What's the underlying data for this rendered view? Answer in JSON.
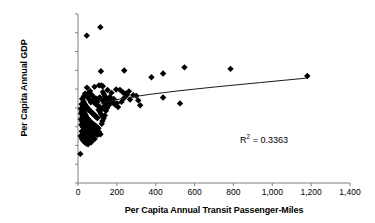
{
  "chart_data": {
    "type": "scatter",
    "title": "",
    "xlabel": "Per Capita Annual Transit Passenger-Miles",
    "ylabel": "Per Capita Annual GDP",
    "xlim": [
      0,
      1400
    ],
    "ylim": [
      0,
      90000
    ],
    "xticks": [
      0,
      200,
      400,
      600,
      800,
      1000,
      1200,
      1400
    ],
    "xticklabels": [
      "0",
      "200",
      "400",
      "600",
      "800",
      "1,000",
      "1,200",
      "1,400"
    ],
    "yticks": [
      0,
      10000,
      20000,
      30000,
      40000,
      50000,
      60000,
      70000,
      80000,
      90000
    ],
    "yticklabels": [
      "$0",
      "$10,000",
      "$20,000",
      "$30,000",
      "$40,000",
      "$50,000",
      "$60,000",
      "$70,000",
      "$80,000",
      "$90,000"
    ],
    "grid": false,
    "legend": null,
    "annotations": [
      {
        "name": "r-squared",
        "text": "R2 = 0.3363",
        "value": 0.3363,
        "x": 900,
        "y": 24000
      }
    ],
    "marker": {
      "shape": "diamond",
      "color": "#000000",
      "size": 3.2
    },
    "trendline": {
      "type": "logarithmic",
      "color": "#1a1a1a",
      "width": 1,
      "points": [
        [
          110,
          41800
        ],
        [
          140,
          42900
        ],
        [
          175,
          43900
        ],
        [
          215,
          44700
        ],
        [
          260,
          45500
        ],
        [
          310,
          46300
        ],
        [
          370,
          47200
        ],
        [
          440,
          48100
        ],
        [
          520,
          49100
        ],
        [
          610,
          50100
        ],
        [
          710,
          51200
        ],
        [
          820,
          52300
        ],
        [
          940,
          53500
        ],
        [
          1060,
          54700
        ],
        [
          1180,
          55900
        ]
      ]
    },
    "points": [
      [
        12,
        15500
      ],
      [
        45,
        78500
      ],
      [
        115,
        83000
      ],
      [
        118,
        59500
      ],
      [
        238,
        59900
      ],
      [
        548,
        61600
      ],
      [
        785,
        60800
      ],
      [
        378,
        56300
      ],
      [
        438,
        58300
      ],
      [
        1180,
        57000
      ],
      [
        85,
        51200
      ],
      [
        108,
        52000
      ],
      [
        120,
        51900
      ],
      [
        128,
        51500
      ],
      [
        152,
        49500
      ],
      [
        172,
        48000
      ],
      [
        196,
        49800
      ],
      [
        216,
        49600
      ],
      [
        232,
        48200
      ],
      [
        252,
        47000
      ],
      [
        300,
        46400
      ],
      [
        70,
        47000
      ],
      [
        78,
        46000
      ],
      [
        92,
        45000
      ],
      [
        96,
        44200
      ],
      [
        100,
        43200
      ],
      [
        112,
        45600
      ],
      [
        124,
        44300
      ],
      [
        136,
        43000
      ],
      [
        148,
        42000
      ],
      [
        160,
        41500
      ],
      [
        180,
        42800
      ],
      [
        200,
        42500
      ],
      [
        236,
        45100
      ],
      [
        268,
        44500
      ],
      [
        320,
        41400
      ],
      [
        438,
        45500
      ],
      [
        525,
        42400
      ],
      [
        22,
        44800
      ],
      [
        28,
        43500
      ],
      [
        32,
        42500
      ],
      [
        36,
        41800
      ],
      [
        40,
        41000
      ],
      [
        44,
        40500
      ],
      [
        48,
        40000
      ],
      [
        52,
        39500
      ],
      [
        56,
        39000
      ],
      [
        60,
        38600
      ],
      [
        64,
        38200
      ],
      [
        68,
        37800
      ],
      [
        72,
        37400
      ],
      [
        76,
        37000
      ],
      [
        80,
        36600
      ],
      [
        84,
        36200
      ],
      [
        88,
        35800
      ],
      [
        92,
        35400
      ],
      [
        96,
        35000
      ],
      [
        100,
        34600
      ],
      [
        18,
        42000
      ],
      [
        24,
        40200
      ],
      [
        30,
        38800
      ],
      [
        34,
        37600
      ],
      [
        38,
        36500
      ],
      [
        42,
        35500
      ],
      [
        46,
        34800
      ],
      [
        50,
        34200
      ],
      [
        54,
        33600
      ],
      [
        58,
        33000
      ],
      [
        62,
        32500
      ],
      [
        66,
        32000
      ],
      [
        70,
        31500
      ],
      [
        74,
        31000
      ],
      [
        78,
        30500
      ],
      [
        82,
        30000
      ],
      [
        86,
        29500
      ],
      [
        90,
        29000
      ],
      [
        94,
        28500
      ],
      [
        98,
        28000
      ],
      [
        14,
        39500
      ],
      [
        20,
        38000
      ],
      [
        26,
        36800
      ],
      [
        33,
        35800
      ],
      [
        39,
        35000
      ],
      [
        45,
        34300
      ],
      [
        51,
        33700
      ],
      [
        57,
        33100
      ],
      [
        63,
        32600
      ],
      [
        69,
        32100
      ],
      [
        75,
        31600
      ],
      [
        81,
        31100
      ],
      [
        87,
        30600
      ],
      [
        93,
        30100
      ],
      [
        99,
        29600
      ],
      [
        105,
        29100
      ],
      [
        16,
        37000
      ],
      [
        23,
        35600
      ],
      [
        29,
        34500
      ],
      [
        35,
        33600
      ],
      [
        41,
        32900
      ],
      [
        47,
        32300
      ],
      [
        53,
        31800
      ],
      [
        59,
        31300
      ],
      [
        65,
        30800
      ],
      [
        71,
        30300
      ],
      [
        77,
        29800
      ],
      [
        83,
        29300
      ],
      [
        89,
        28800
      ],
      [
        95,
        28300
      ],
      [
        101,
        27800
      ],
      [
        107,
        27300
      ],
      [
        15,
        34000
      ],
      [
        21,
        32800
      ],
      [
        27,
        31900
      ],
      [
        34,
        31200
      ],
      [
        40,
        30600
      ],
      [
        46,
        30100
      ],
      [
        52,
        29600
      ],
      [
        58,
        29100
      ],
      [
        64,
        28600
      ],
      [
        70,
        28100
      ],
      [
        76,
        27600
      ],
      [
        82,
        27100
      ],
      [
        88,
        26600
      ],
      [
        94,
        26100
      ],
      [
        100,
        25600
      ],
      [
        17,
        31000
      ],
      [
        25,
        29800
      ],
      [
        31,
        28900
      ],
      [
        37,
        28200
      ],
      [
        43,
        27600
      ],
      [
        49,
        27000
      ],
      [
        55,
        26400
      ],
      [
        61,
        25800
      ],
      [
        67,
        25200
      ],
      [
        73,
        24600
      ],
      [
        79,
        24000
      ],
      [
        85,
        23400
      ],
      [
        19,
        27500
      ],
      [
        26,
        26200
      ],
      [
        33,
        25200
      ],
      [
        40,
        24400
      ],
      [
        47,
        23700
      ],
      [
        54,
        23000
      ],
      [
        61,
        22300
      ],
      [
        68,
        21700
      ],
      [
        13,
        25000
      ],
      [
        20,
        23500
      ],
      [
        28,
        22400
      ],
      [
        36,
        21600
      ],
      [
        44,
        21000
      ],
      [
        52,
        20600
      ],
      [
        104,
        26900
      ],
      [
        110,
        26400
      ],
      [
        116,
        25900
      ],
      [
        122,
        31500
      ],
      [
        126,
        33000
      ],
      [
        132,
        34500
      ],
      [
        138,
        36000
      ],
      [
        144,
        38500
      ],
      [
        150,
        40000
      ],
      [
        106,
        39000
      ],
      [
        112,
        38000
      ],
      [
        118,
        36800
      ],
      [
        124,
        35600
      ],
      [
        130,
        39800
      ],
      [
        136,
        41200
      ],
      [
        156,
        44000
      ],
      [
        164,
        45800
      ],
      [
        170,
        43500
      ],
      [
        184,
        44800
      ],
      [
        190,
        41800
      ],
      [
        206,
        40500
      ],
      [
        224,
        43200
      ],
      [
        244,
        47500
      ],
      [
        262,
        48800
      ],
      [
        284,
        46800
      ],
      [
        310,
        44000
      ],
      [
        66,
        43000
      ],
      [
        58,
        44500
      ],
      [
        50,
        45800
      ],
      [
        42,
        46800
      ],
      [
        36,
        47600
      ],
      [
        30,
        46200
      ],
      [
        24,
        45000
      ],
      [
        92,
        42000
      ],
      [
        86,
        42600
      ],
      [
        80,
        43200
      ],
      [
        74,
        43800
      ],
      [
        102,
        41200
      ],
      [
        108,
        40600
      ],
      [
        114,
        40000
      ],
      [
        120,
        39400
      ],
      [
        46,
        50800
      ],
      [
        62,
        49000
      ],
      [
        54,
        48000
      ],
      [
        128,
        48500
      ],
      [
        134,
        47200
      ],
      [
        140,
        46000
      ],
      [
        146,
        45000
      ]
    ]
  }
}
